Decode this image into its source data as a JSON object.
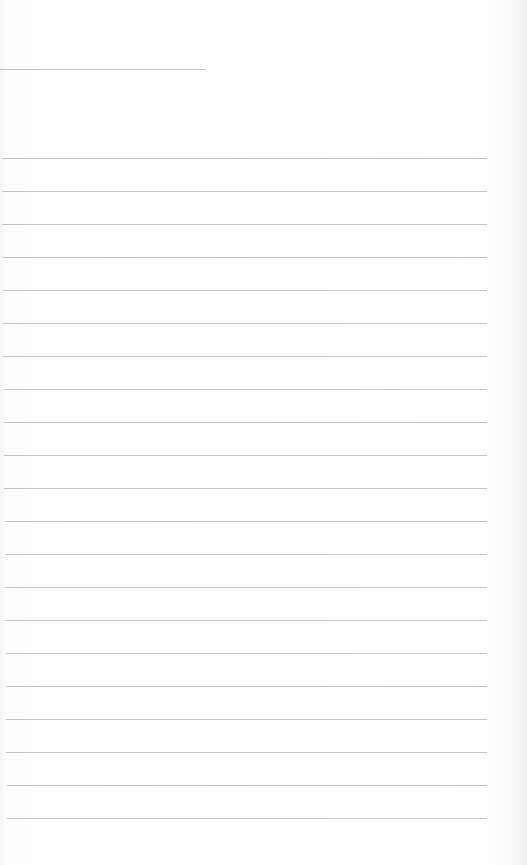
{
  "image": {
    "subject": "blank lined notepad page",
    "paper_color": "#fdfdfd",
    "line_color": "#c4c4c4"
  },
  "header_line": {
    "x": 0,
    "y": 69,
    "width": 206
  },
  "rules": {
    "count": 21,
    "first_y": 158,
    "spacing": 33,
    "x_start": 2,
    "x_end": 487
  }
}
